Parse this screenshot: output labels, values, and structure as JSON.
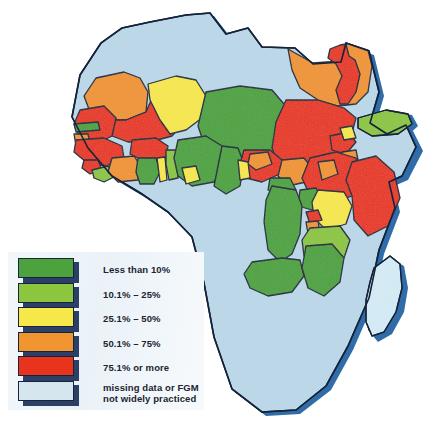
{
  "figure": {
    "kind": "choropleth-map",
    "region": "Africa",
    "topic": "Prevalence of FGM"
  },
  "legend": {
    "title": "",
    "items": [
      {
        "label": "Less than 10%",
        "color": "#4ca33d",
        "bucket": "0-10"
      },
      {
        "label": "10.1% – 25%",
        "color": "#8cc63f",
        "bucket": "10.1-25"
      },
      {
        "label": "25.1% – 50%",
        "color": "#f7e84a",
        "bucket": "25.1-50"
      },
      {
        "label": "50.1% – 75%",
        "color": "#f0952f",
        "bucket": "50.1-75"
      },
      {
        "label": "75.1% or more",
        "color": "#e8341c",
        "bucket": "75.1-100"
      },
      {
        "label": "missing data or FGM\nnot widely practiced",
        "color": "#d5e6ef",
        "bucket": "missing"
      }
    ]
  },
  "map_colors": {
    "ocean": "#ffffff",
    "outline": "#14223a",
    "coast_shadow": "#2f6ca8",
    "drop_shadow": "#c9d4df",
    "missing": "#bcd8e8",
    "green": "#4ca33d",
    "lightgreen": "#8cc63f",
    "yellow": "#f7e84a",
    "orange": "#f0952f",
    "red": "#e8341c"
  },
  "chart_data": {
    "type": "choropleth",
    "legend_position": "bottom-left",
    "categories": [
      "Less than 10%",
      "10.1% – 25%",
      "25.1% – 50%",
      "50.1% – 75%",
      "75.1% or more",
      "missing data or FGM not widely practiced"
    ],
    "regions": [
      {
        "name": "Morocco",
        "bucket": "missing"
      },
      {
        "name": "Western Sahara",
        "bucket": "missing"
      },
      {
        "name": "Algeria",
        "bucket": "missing"
      },
      {
        "name": "Tunisia",
        "bucket": "missing"
      },
      {
        "name": "Libya",
        "bucket": "missing"
      },
      {
        "name": "Egypt",
        "bucket": "50.1-75"
      },
      {
        "name": "Nile Valley (Egypt)",
        "bucket": "75.1-100"
      },
      {
        "name": "Mauritania",
        "bucket": "50.1-75"
      },
      {
        "name": "Senegal",
        "bucket": "75.1-100"
      },
      {
        "name": "Gambia",
        "bucket": "0-10"
      },
      {
        "name": "Mali",
        "bucket": "75.1-100"
      },
      {
        "name": "Niger",
        "bucket": "25.1-50"
      },
      {
        "name": "Guinea",
        "bucket": "75.1-100"
      },
      {
        "name": "Guinea-Bissau",
        "bucket": "50.1-75"
      },
      {
        "name": "Sierra Leone",
        "bucket": "75.1-100"
      },
      {
        "name": "Liberia",
        "bucket": "10.1-25"
      },
      {
        "name": "Cote d'Ivoire",
        "bucket": "50.1-75"
      },
      {
        "name": "Burkina Faso",
        "bucket": "75.1-100"
      },
      {
        "name": "Ghana",
        "bucket": "0-10"
      },
      {
        "name": "Togo",
        "bucket": "25.1-50"
      },
      {
        "name": "Benin",
        "bucket": "10.1-25"
      },
      {
        "name": "Nigeria",
        "bucket": "25.1-50"
      },
      {
        "name": "Cameroon",
        "bucket": "0-10"
      },
      {
        "name": "Chad",
        "bucket": "75.1-100"
      },
      {
        "name": "Sudan",
        "bucket": "75.1-100"
      },
      {
        "name": "Eritrea",
        "bucket": "75.1-100"
      },
      {
        "name": "Djibouti",
        "bucket": "75.1-100"
      },
      {
        "name": "Ethiopia",
        "bucket": "75.1-100"
      },
      {
        "name": "Somalia",
        "bucket": "75.1-100"
      },
      {
        "name": "Yemen",
        "bucket": "10.1-25"
      },
      {
        "name": "Central African Republic",
        "bucket": "25.1-50"
      },
      {
        "name": "South Sudan region",
        "bucket": "50.1-75"
      },
      {
        "name": "Uganda",
        "bucket": "0-10"
      },
      {
        "name": "Kenya",
        "bucket": "25.1-50"
      },
      {
        "name": "Rwanda",
        "bucket": "75.1-100"
      },
      {
        "name": "Burundi",
        "bucket": "25.1-50"
      },
      {
        "name": "Tanzania",
        "bucket": "10.1-25"
      },
      {
        "name": "DR Congo",
        "bucket": "0-10"
      },
      {
        "name": "Congo",
        "bucket": "missing"
      },
      {
        "name": "Gabon",
        "bucket": "missing"
      },
      {
        "name": "Equatorial Guinea",
        "bucket": "missing"
      },
      {
        "name": "Angola",
        "bucket": "missing"
      },
      {
        "name": "Zambia",
        "bucket": "0-10"
      },
      {
        "name": "Malawi",
        "bucket": "0-10"
      },
      {
        "name": "Mozambique",
        "bucket": "0-10"
      },
      {
        "name": "Zimbabwe",
        "bucket": "missing"
      },
      {
        "name": "Botswana",
        "bucket": "missing"
      },
      {
        "name": "Namibia",
        "bucket": "missing"
      },
      {
        "name": "South Africa",
        "bucket": "missing"
      },
      {
        "name": "Lesotho",
        "bucket": "missing"
      },
      {
        "name": "Swaziland",
        "bucket": "missing"
      },
      {
        "name": "Madagascar",
        "bucket": "missing"
      }
    ]
  }
}
